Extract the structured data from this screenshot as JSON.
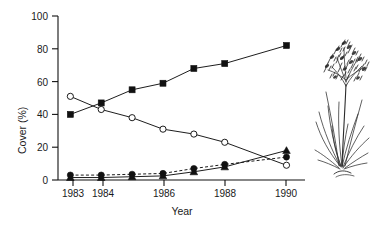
{
  "figure": {
    "name": "cover-vs-year-line-chart",
    "background": "#ffffff",
    "ink_color": "#111111"
  },
  "axes": {
    "xlabel": "Year",
    "ylabel": "Cover (%)",
    "x_ticks": [
      "1983",
      "1984",
      "1986",
      "1988",
      "1990"
    ],
    "y_ticks": [
      "0",
      "20",
      "40",
      "60",
      "80",
      "100"
    ]
  },
  "illustration": {
    "name": "grass-plant-illustration",
    "caption": "tufted flowering grass line drawing"
  },
  "chart_data": {
    "type": "line",
    "title": "",
    "xlabel": "Year",
    "ylabel": "Cover (%)",
    "xlim": [
      1982.6,
      1990.6
    ],
    "ylim": [
      0,
      100
    ],
    "xticks": [
      1983,
      1984,
      1986,
      1988,
      1990
    ],
    "yticks": [
      0,
      20,
      40,
      60,
      80,
      100
    ],
    "grid": false,
    "legend": "none",
    "x": [
      1983,
      1984,
      1985,
      1986,
      1987,
      1988,
      1990
    ],
    "series": [
      {
        "name": "filled-square-series",
        "marker": "square",
        "fill": "solid",
        "linestyle": "solid",
        "x": [
          1983,
          1984,
          1985,
          1986,
          1987,
          1988,
          1990
        ],
        "values": [
          40,
          47,
          55,
          59,
          68,
          71,
          82
        ]
      },
      {
        "name": "open-circle-series",
        "marker": "circle",
        "fill": "open",
        "linestyle": "solid",
        "x": [
          1983,
          1984,
          1985,
          1986,
          1987,
          1988,
          1990
        ],
        "values": [
          51,
          43,
          38,
          31,
          28,
          23,
          9
        ]
      },
      {
        "name": "filled-circle-series",
        "marker": "circle",
        "fill": "solid",
        "linestyle": "dashed",
        "x": [
          1983,
          1984,
          1985,
          1986,
          1987,
          1988,
          1990
        ],
        "values": [
          3,
          3,
          3.5,
          4,
          7,
          9.5,
          14
        ]
      },
      {
        "name": "filled-triangle-series",
        "marker": "triangle",
        "fill": "solid",
        "linestyle": "solid",
        "x": [
          1983,
          1984,
          1985,
          1986,
          1987,
          1988,
          1990
        ],
        "values": [
          1.5,
          1.5,
          2,
          2.5,
          5,
          8,
          18
        ]
      }
    ]
  }
}
